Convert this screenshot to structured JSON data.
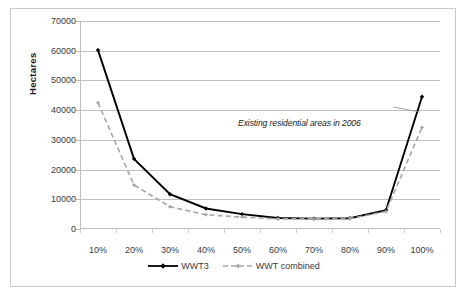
{
  "chart_data": {
    "type": "line",
    "title": "",
    "xlabel": "",
    "ylabel": "Hectares",
    "categories": [
      "10%",
      "20%",
      "30%",
      "40%",
      "50%",
      "60%",
      "70%",
      "80%",
      "90%",
      "100%"
    ],
    "ylim": [
      0,
      70000
    ],
    "ytick_labels": [
      "70000",
      "60000",
      "50000",
      "40000",
      "30000",
      "20000",
      "10000",
      "0"
    ],
    "ytick_values": [
      70000,
      60000,
      50000,
      40000,
      30000,
      20000,
      10000,
      0
    ],
    "grid": "horizontal",
    "legend_position": "bottom",
    "series": [
      {
        "name": "WWT3",
        "style": "solid",
        "color": "#000000",
        "marker": "diamond",
        "values": [
          60200,
          23600,
          11700,
          6900,
          5000,
          3700,
          3500,
          3600,
          6300,
          44500
        ]
      },
      {
        "name": "WWT combined",
        "style": "dashed",
        "color": "#a6a6a6",
        "marker": "diamond",
        "values": [
          42500,
          14800,
          7500,
          4800,
          4000,
          3400,
          3400,
          3500,
          5900,
          34200
        ]
      }
    ],
    "annotations": [
      {
        "text": "Existing residential areas in 2006",
        "x_category": "100%",
        "y_value": 35500,
        "leader_line": true
      }
    ]
  },
  "legend": {
    "items": [
      {
        "label": "WWT3",
        "icon": "solid-line-with-marker-icon"
      },
      {
        "label": "WWT combined",
        "icon": "dashed-line-with-marker-icon"
      }
    ]
  },
  "axis": {
    "y_title": "Hectares"
  },
  "footer": {
    "ghost_text": ""
  },
  "colors": {
    "series_primary": "#000000",
    "series_secondary": "#a6a6a6",
    "gridline": "#bfbfbf",
    "frame": "#c9c9c9",
    "text": "#3a3a3a"
  }
}
